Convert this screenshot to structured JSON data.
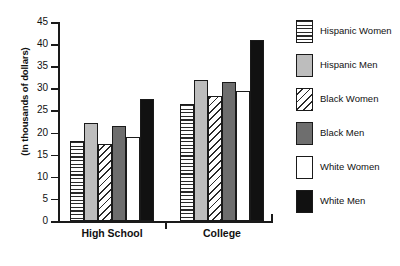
{
  "chart_data": {
    "type": "bar",
    "title": "",
    "xlabel": "",
    "ylabel": "(In thousands of dollars)",
    "categories": [
      "High School",
      "College"
    ],
    "series": [
      {
        "name": "Hispanic Women",
        "values": [
          18.0,
          26.5
        ],
        "pattern": "horizontal-stripes",
        "color": "#ffffff"
      },
      {
        "name": "Hispanic Men",
        "values": [
          22.2,
          32.0
        ],
        "pattern": "solid",
        "color": "#bdbdbd"
      },
      {
        "name": "Black Women",
        "values": [
          17.5,
          28.3
        ],
        "pattern": "diagonal-hatch",
        "color": "#ffffff"
      },
      {
        "name": "Black Men",
        "values": [
          21.4,
          31.5
        ],
        "pattern": "solid",
        "color": "#6e6e6e"
      },
      {
        "name": "White Women",
        "values": [
          19.0,
          29.5
        ],
        "pattern": "solid",
        "color": "#ffffff"
      },
      {
        "name": "White Men",
        "values": [
          27.5,
          41.0
        ],
        "pattern": "solid",
        "color": "#111111"
      }
    ],
    "ylim": [
      0,
      45
    ],
    "ytick_step": 5,
    "yticks": [
      0,
      5,
      10,
      15,
      20,
      25,
      30,
      35,
      40,
      45
    ],
    "ytick_labels": [
      "0",
      "5",
      "10",
      "15",
      "20",
      "25",
      "30",
      "35",
      "40",
      "45"
    ],
    "grid": false,
    "legend_position": "right",
    "legend_entries": [
      "Hispanic Women",
      "Hispanic Men",
      "Black Women",
      "Black Men",
      "White Women",
      "White Men"
    ]
  }
}
